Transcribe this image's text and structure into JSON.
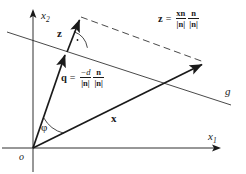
{
  "figure": {
    "type": "vector-projection-diagram",
    "background": "#ffffff",
    "ink": "#1a1a1a",
    "axes": {
      "x1_label": "x",
      "x1_subscript": "1",
      "x2_label": "x",
      "x2_subscript": "2",
      "origin_label": "o"
    },
    "line": {
      "label": "g"
    },
    "vectors": {
      "q_label": "q",
      "z_label": "z",
      "x_label": "x"
    },
    "angles": {
      "phi_label": "φ",
      "right_angle_label": "·"
    },
    "formula_z": {
      "lhs": "z",
      "equals": "=",
      "frac1_num": "xn",
      "frac1_den": "|n|",
      "frac2_num": "n",
      "frac2_den": "|n|"
    },
    "formula_q": {
      "lhs": "q",
      "equals": "=",
      "frac1_num": "−d",
      "frac1_den": "|n|",
      "frac2_num": "n",
      "frac2_den": "|n|"
    }
  }
}
